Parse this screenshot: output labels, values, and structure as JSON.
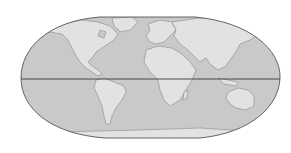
{
  "map": {
    "title": "",
    "projection": "world-ellipse-projection",
    "colors": {
      "background": "#ffffff",
      "ocean": "#c9c9c9",
      "land": "#e2e2e2",
      "coast": "#8a8a8a",
      "outline": "#555555",
      "equator": "#3a3a3a"
    },
    "features": [
      {
        "name": "North America"
      },
      {
        "name": "South America"
      },
      {
        "name": "Europe"
      },
      {
        "name": "Africa"
      },
      {
        "name": "Asia"
      },
      {
        "name": "Australia"
      },
      {
        "name": "Antarctica"
      },
      {
        "name": "Greenland"
      },
      {
        "name": "Madagascar"
      }
    ],
    "lines": [
      {
        "name": "Equator"
      }
    ]
  }
}
